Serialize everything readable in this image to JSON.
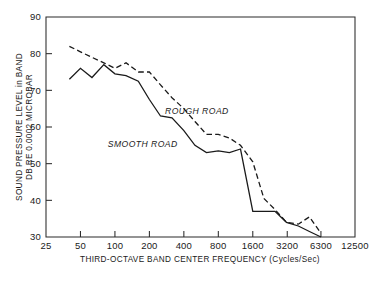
{
  "chart_data": {
    "type": "line",
    "title": "",
    "xlabel": "THIRD-OCTAVE BAND CENTER FREQUENCY (Cycles/Sec)",
    "ylabel": "SOUND PRESSURE LEVEL in BAND DB RE 0.0002 MICROBAR",
    "ylabel_line1": "SOUND PRESSURE LEVEL in BAND",
    "ylabel_line2": "DB RE 0.0002 MICROBAR",
    "xscale": "log",
    "yscale": "linear",
    "xlim": [
      25,
      12500
    ],
    "ylim": [
      30,
      90
    ],
    "grid": false,
    "legend_position": "inline-annotation",
    "xticks": [
      25,
      50,
      100,
      200,
      400,
      800,
      1600,
      3200,
      6300,
      12500
    ],
    "xtick_labels": [
      "25",
      "50",
      "100",
      "200",
      "400",
      "800",
      "1600",
      "3200",
      "6300",
      "12500"
    ],
    "yticks": [
      30,
      40,
      50,
      60,
      70,
      80,
      90
    ],
    "ytick_labels": [
      "30",
      "40",
      "50",
      "60",
      "70",
      "80",
      "90"
    ],
    "series": [
      {
        "name": "ROUGH ROAD",
        "style": "dashed",
        "color": "#1a1a1a",
        "annotation": "ROUGH ROAD",
        "x": [
          40,
          50,
          63,
          80,
          100,
          125,
          160,
          200,
          250,
          315,
          400,
          500,
          630,
          800,
          1000,
          1250,
          1600,
          2000,
          2500,
          3150,
          4000,
          5000,
          6300
        ],
        "values": [
          82.0,
          80.5,
          79.0,
          77.5,
          76.0,
          77.5,
          75.0,
          75.0,
          71.5,
          68.0,
          65.0,
          61.5,
          58.0,
          58.0,
          57.0,
          55.0,
          50.5,
          40.5,
          37.5,
          34.0,
          33.5,
          35.5,
          31.0
        ]
      },
      {
        "name": "SMOOTH ROAD",
        "style": "solid",
        "color": "#1a1a1a",
        "annotation": "SMOOTH ROAD",
        "x": [
          40,
          50,
          63,
          80,
          100,
          125,
          160,
          200,
          250,
          315,
          400,
          500,
          630,
          800,
          1000,
          1250,
          1600,
          2000,
          2500,
          3150,
          4000,
          5000,
          6300
        ],
        "values": [
          73.0,
          76.0,
          73.5,
          77.0,
          74.5,
          74.0,
          72.5,
          67.5,
          63.0,
          62.5,
          59.0,
          55.0,
          53.0,
          53.5,
          53.0,
          54.0,
          37.0,
          37.0,
          37.0,
          34.0,
          33.0,
          31.5,
          30.0
        ]
      }
    ],
    "annotations": [
      {
        "text": "ROUGH ROAD",
        "x_freq": 520,
        "y_db": 63.5
      },
      {
        "text": "SMOOTH ROAD",
        "x_freq": 175,
        "y_db": 54.5
      }
    ]
  },
  "axes": {
    "x_axis_title": "THIRD-OCTAVE BAND CENTER FREQUENCY (Cycles/Sec)",
    "y_axis_title_line1": "SOUND PRESSURE LEVEL in BAND",
    "y_axis_title_line2": "DB RE 0.0002 MICROBAR"
  },
  "colors": {
    "ink": "#1a1a1a",
    "frame": "#2b2b2b",
    "background": "#ffffff"
  }
}
